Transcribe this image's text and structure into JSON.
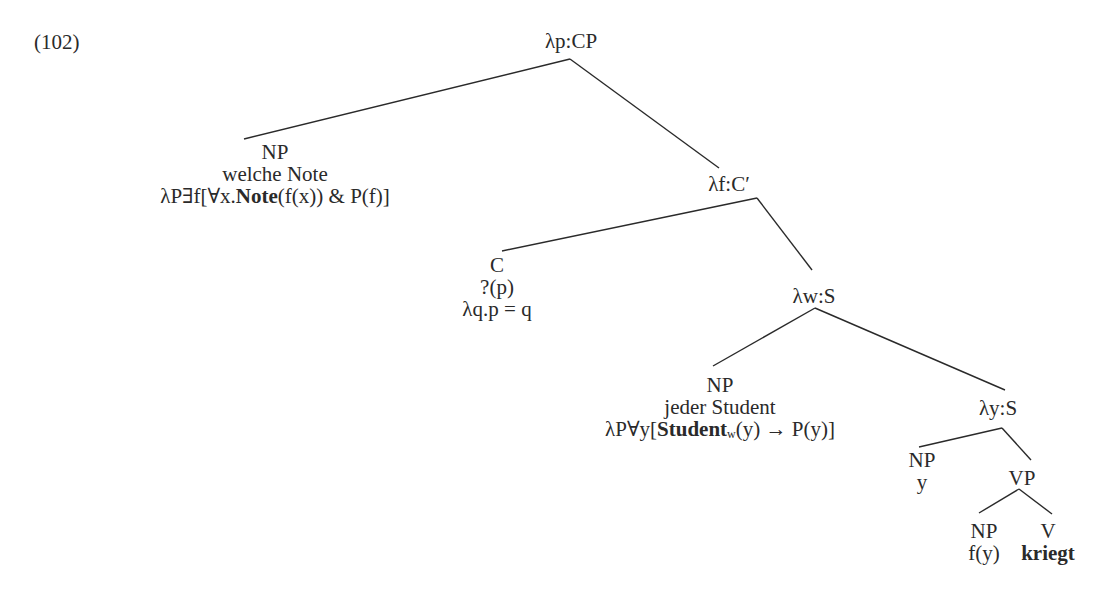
{
  "figure": {
    "example_number": "(102)",
    "ink_color": "#2a2a2a",
    "background": "#ffffff"
  },
  "nodes": [
    {
      "id": "root",
      "x": 571,
      "y": 30,
      "lines": [
        [
          {
            "t": "λp:CP"
          }
        ]
      ]
    },
    {
      "id": "np-welche-note",
      "x": 275,
      "y": 141,
      "lines": [
        [
          {
            "t": "NP"
          }
        ],
        [
          {
            "t": "welche Note"
          }
        ],
        [
          {
            "t": "λP∃f[∀x."
          },
          {
            "t": "Note",
            "b": true
          },
          {
            "t": "(f(x)) & P(f)]"
          }
        ]
      ]
    },
    {
      "id": "cbar",
      "x": 729,
      "y": 173,
      "lines": [
        [
          {
            "t": "λf:C′"
          }
        ]
      ]
    },
    {
      "id": "c",
      "x": 497,
      "y": 254,
      "lines": [
        [
          {
            "t": "C"
          }
        ],
        [
          {
            "t": "?(p)"
          }
        ],
        [
          {
            "t": "λq.p = q"
          }
        ]
      ]
    },
    {
      "id": "s-w",
      "x": 814,
      "y": 285,
      "lines": [
        [
          {
            "t": "λw:S"
          }
        ]
      ]
    },
    {
      "id": "np-jeder-student",
      "x": 720,
      "y": 374,
      "lines": [
        [
          {
            "t": "NP"
          }
        ],
        [
          {
            "t": "jeder Student"
          }
        ],
        [
          {
            "t": "λP∀y["
          },
          {
            "t": "Student",
            "b": true
          },
          {
            "t": "w",
            "sub": true
          },
          {
            "t": "(y) → P(y)]"
          }
        ]
      ]
    },
    {
      "id": "s-y",
      "x": 998,
      "y": 397,
      "lines": [
        [
          {
            "t": "λy:S"
          }
        ]
      ]
    },
    {
      "id": "np-y",
      "x": 922,
      "y": 449,
      "lines": [
        [
          {
            "t": "NP"
          }
        ],
        [
          {
            "t": "y"
          }
        ]
      ]
    },
    {
      "id": "vp",
      "x": 1022,
      "y": 467,
      "lines": [
        [
          {
            "t": "VP"
          }
        ]
      ]
    },
    {
      "id": "np-fy",
      "x": 984,
      "y": 520,
      "lines": [
        [
          {
            "t": "NP"
          }
        ],
        [
          {
            "t": "f(y)"
          }
        ]
      ]
    },
    {
      "id": "v-kriegt",
      "x": 1048,
      "y": 520,
      "lines": [
        [
          {
            "t": "V"
          }
        ],
        [
          {
            "t": "kriegt",
            "b": true
          }
        ]
      ]
    }
  ],
  "edges": [
    {
      "from": "root",
      "to": "np-welche-note",
      "x1": 570,
      "y1": 59,
      "x2": 244,
      "y2": 139
    },
    {
      "from": "root",
      "to": "cbar",
      "x1": 570,
      "y1": 59,
      "x2": 719,
      "y2": 168
    },
    {
      "from": "cbar",
      "to": "c",
      "x1": 757,
      "y1": 198,
      "x2": 502,
      "y2": 251
    },
    {
      "from": "cbar",
      "to": "s-w",
      "x1": 757,
      "y1": 198,
      "x2": 812,
      "y2": 270
    },
    {
      "from": "s-w",
      "to": "np-jeder-student",
      "x1": 815,
      "y1": 308,
      "x2": 713,
      "y2": 366
    },
    {
      "from": "s-w",
      "to": "s-y",
      "x1": 815,
      "y1": 308,
      "x2": 1005,
      "y2": 390
    },
    {
      "from": "s-y",
      "to": "np-y",
      "x1": 1002,
      "y1": 428,
      "x2": 919,
      "y2": 447
    },
    {
      "from": "s-y",
      "to": "vp",
      "x1": 1002,
      "y1": 428,
      "x2": 1031,
      "y2": 460
    },
    {
      "from": "vp",
      "to": "np-fy",
      "x1": 1019,
      "y1": 489,
      "x2": 979,
      "y2": 513
    },
    {
      "from": "vp",
      "to": "v-kriegt",
      "x1": 1019,
      "y1": 489,
      "x2": 1052,
      "y2": 514
    }
  ]
}
